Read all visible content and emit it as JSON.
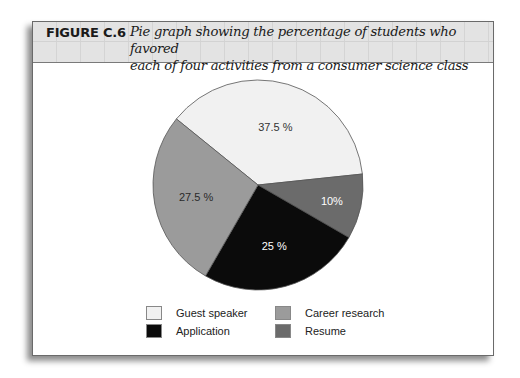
{
  "figure": {
    "number": "FIGURE C.6",
    "caption_line1": "Pie graph showing the percentage of students who favored",
    "caption_line2": "each of four activities from a consumer science class"
  },
  "chart_data": {
    "type": "pie",
    "title": "Pie graph showing the percentage of students who favored each of four activities from a consumer science class",
    "categories": [
      "Guest speaker",
      "Resume",
      "Application",
      "Career research"
    ],
    "values": [
      37.5,
      10,
      25,
      27.5
    ],
    "labels": [
      "37.5 %",
      "10%",
      "25 %",
      "27.5 %"
    ],
    "colors": [
      "#f1f1f1",
      "#6b6b6b",
      "#0b0b0b",
      "#9b9b9b"
    ],
    "label_colors": [
      "#333333",
      "#ffffff",
      "#ffffff",
      "#2a2a2a"
    ],
    "legend_position": "bottom",
    "xlabel": "",
    "ylabel": ""
  },
  "legend": {
    "items": [
      {
        "label": "Guest speaker",
        "color": "#f1f1f1"
      },
      {
        "label": "Career research",
        "color": "#9b9b9b"
      },
      {
        "label": "Application",
        "color": "#0b0b0b"
      },
      {
        "label": "Resume",
        "color": "#6b6b6b"
      }
    ]
  }
}
